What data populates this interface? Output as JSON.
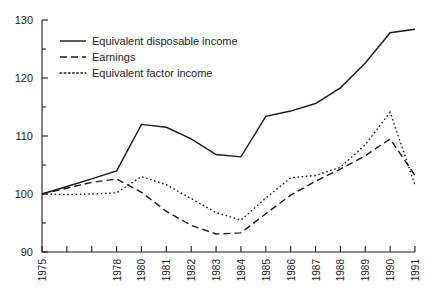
{
  "chart_data": {
    "type": "line",
    "title": "",
    "subtitle": "",
    "xlabel": "",
    "ylabel": "",
    "grid": false,
    "legend_position": "top-left",
    "xlim": [
      1975,
      1991
    ],
    "ylim": [
      90,
      130
    ],
    "ytick_labels": [
      "130",
      "120",
      "110",
      "100",
      "90"
    ],
    "ytick_values": [
      130,
      120,
      110,
      100,
      90
    ],
    "yminor_values": [
      125,
      115,
      105,
      95
    ],
    "x": [
      1975,
      1976,
      1977,
      1978,
      1980,
      1981,
      1982,
      1983,
      1984,
      1985,
      1986,
      1987,
      1988,
      1989,
      1990,
      1991
    ],
    "xtick_labels": [
      "1975",
      "",
      "",
      "1978",
      "1980",
      "1981",
      "1982",
      "1983",
      "1984",
      "1985",
      "1986",
      "1987",
      "1988",
      "1989",
      "1990",
      "1991"
    ],
    "series": [
      {
        "name": "Equivalent disposable income",
        "style": "solid",
        "color": "#1a1a1a",
        "values": [
          100,
          101.3,
          102.6,
          104,
          112,
          111.5,
          109.5,
          106.8,
          106.4,
          113.4,
          114.3,
          115.6,
          118.3,
          122.6,
          127.8,
          128.4
        ]
      },
      {
        "name": "Earnings",
        "style": "dashed",
        "color": "#1a1a1a",
        "values": [
          100,
          101,
          102,
          102.6,
          100.3,
          97,
          94.6,
          93.1,
          93.3,
          96.6,
          99.8,
          102.2,
          104.3,
          106.6,
          109.5,
          103.2
        ]
      },
      {
        "name": "Equivalent factor income",
        "style": "dotted",
        "color": "#1a1a1a",
        "values": [
          100,
          99.9,
          100,
          100.2,
          103,
          101.6,
          99.2,
          96.8,
          95.5,
          99.3,
          102.8,
          103.2,
          104.6,
          108.5,
          114.1,
          101.5
        ]
      }
    ]
  },
  "legend": {
    "items": [
      {
        "label": "Equivalent disposable income",
        "style": "solid"
      },
      {
        "label": "Earnings",
        "style": "dashed"
      },
      {
        "label": "Equivalent factor income",
        "style": "dotted"
      }
    ]
  }
}
